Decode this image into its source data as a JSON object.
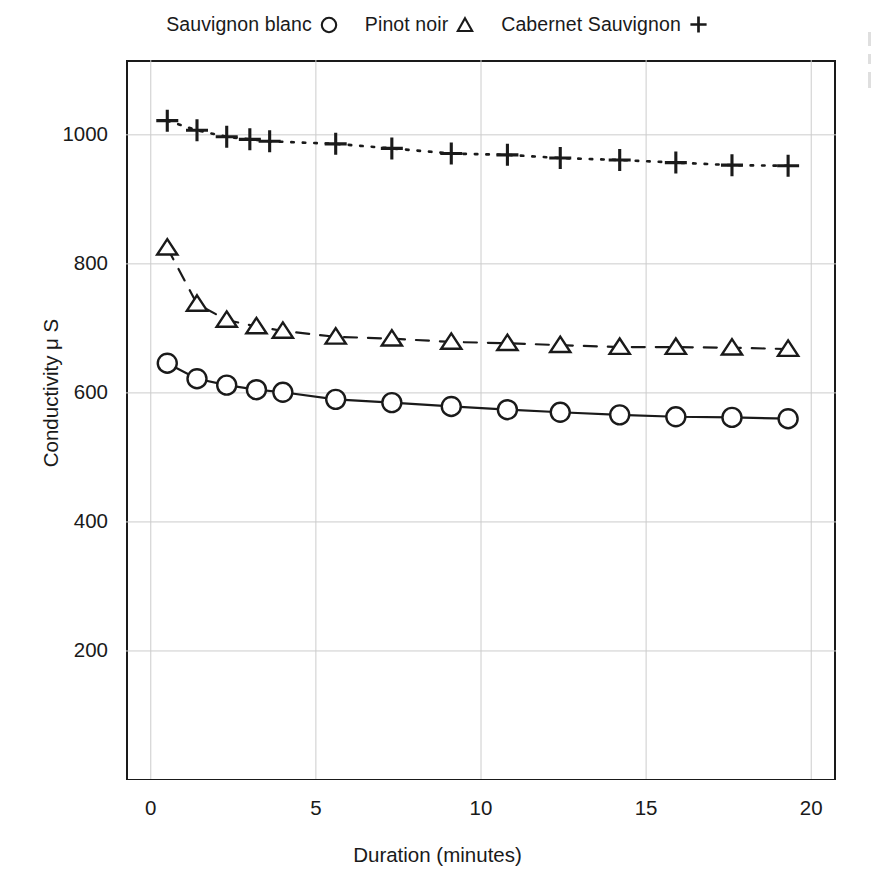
{
  "chart_data": {
    "type": "line",
    "title": "",
    "xlabel": "Duration (minutes)",
    "ylabel": "Conductivity μ S",
    "xlim": [
      -0.75,
      20.75
    ],
    "ylim": [
      0,
      1116
    ],
    "xticks": [
      0,
      5,
      10,
      15,
      20
    ],
    "yticks": [
      200,
      400,
      600,
      800,
      1000
    ],
    "xtick_labels": [
      "0",
      "5",
      "10",
      "15",
      "20"
    ],
    "ytick_labels": [
      "200",
      "400",
      "600",
      "800",
      "1000"
    ],
    "grid": true,
    "grid_color": "#cccccc",
    "legend_position": "top-center",
    "series": [
      {
        "name": "Sauvignon blanc",
        "marker": "circle",
        "linestyle": "solid",
        "color": "#1a1a1a",
        "x": [
          0.5,
          1.4,
          2.3,
          3.2,
          4.0,
          5.6,
          7.3,
          9.1,
          10.8,
          12.4,
          14.2,
          15.9,
          17.6,
          19.3
        ],
        "y": [
          646,
          622,
          612,
          605,
          601,
          590,
          585,
          579,
          574,
          570,
          566,
          563,
          562,
          560
        ]
      },
      {
        "name": "Pinot noir",
        "marker": "triangle",
        "linestyle": "dashed",
        "color": "#1a1a1a",
        "x": [
          0.5,
          1.4,
          2.3,
          3.2,
          4.0,
          5.6,
          7.3,
          9.1,
          10.8,
          12.4,
          14.2,
          15.9,
          17.6,
          19.3
        ],
        "y": [
          825,
          738,
          713,
          703,
          696,
          687,
          684,
          679,
          677,
          674,
          671,
          671,
          670,
          668
        ]
      },
      {
        "name": "Cabernet Sauvignon",
        "marker": "plus",
        "linestyle": "dotted",
        "color": "#1a1a1a",
        "x": [
          0.5,
          1.4,
          2.3,
          3.0,
          3.6,
          5.6,
          7.3,
          9.1,
          10.8,
          12.4,
          14.2,
          15.9,
          17.6,
          19.3
        ],
        "y": [
          1022,
          1007,
          997,
          993,
          990,
          986,
          979,
          971,
          969,
          964,
          961,
          957,
          953,
          952
        ]
      }
    ]
  },
  "legend": {
    "entries": [
      {
        "label": "Sauvignon blanc",
        "glyph": "circle"
      },
      {
        "label": "Pinot noir",
        "glyph": "triangle"
      },
      {
        "label": "Cabernet Sauvignon",
        "glyph": "plus"
      }
    ]
  },
  "axes": {
    "x_axis_label": "Duration (minutes)",
    "y_axis_label": "Conductivity μ S"
  }
}
